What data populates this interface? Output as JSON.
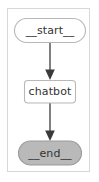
{
  "diagram": {
    "kind": "state-graph",
    "frame": {
      "border_color": "#d8d8d8",
      "background_color": "#ffffff"
    },
    "nodes": [
      {
        "id": "start",
        "label": "__start__",
        "shape": "stadium",
        "fill": "#ffffff",
        "stroke": "#b8b8b8",
        "text_color": "#333333"
      },
      {
        "id": "chatbot",
        "label": "chatbot",
        "shape": "rounded-rect",
        "fill": "#ffffff",
        "stroke": "#b8b8b8",
        "text_color": "#333333"
      },
      {
        "id": "end",
        "label": "__end__",
        "shape": "stadium",
        "fill": "#b9b9b9",
        "stroke": "#9a9a9a",
        "text_color": "#333333"
      }
    ],
    "edges": [
      {
        "id": "start-to-chatbot",
        "from": "start",
        "to": "chatbot",
        "label": "",
        "style": "solid",
        "color": "#4a4a4a",
        "arrowhead": "filled-triangle"
      },
      {
        "id": "chatbot-to-end",
        "from": "chatbot",
        "to": "end",
        "label": "",
        "style": "solid",
        "color": "#4a4a4a",
        "arrowhead": "filled-triangle"
      }
    ]
  }
}
